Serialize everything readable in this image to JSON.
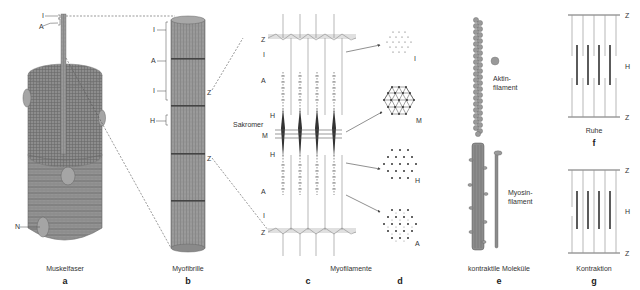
{
  "panels": {
    "a": {
      "letter": "a",
      "caption": "Muskelfaser",
      "labels": {
        "I": "I",
        "A": "A",
        "N": "N"
      }
    },
    "b": {
      "letter": "b",
      "caption": "Myofibrille",
      "labels": {
        "I_top": "I",
        "A": "A",
        "I_bottom": "I",
        "H": "H",
        "Z_top": "Z",
        "Z_bottom": "Z"
      }
    },
    "c": {
      "letter": "c",
      "labels": {
        "Z_top": "Z",
        "I_top": "I",
        "A_top": "A",
        "H_top": "H",
        "sarcomere": "Sakromer",
        "M": "M",
        "H_bottom": "H",
        "A_bottom": "A",
        "I_bottom": "I",
        "Z_bottom": "Z"
      }
    },
    "cd_caption": "Myofilamente",
    "d": {
      "letter": "d",
      "labels": {
        "I": "I",
        "M": "M",
        "H": "H",
        "A": "A"
      }
    },
    "e": {
      "letter": "e",
      "caption": "kontraktile Moleküle",
      "labels": {
        "actin": "Aktin-",
        "actin2": "filament",
        "myosin": "Myosin-",
        "myosin2": "filament"
      }
    },
    "f": {
      "letter": "f",
      "caption": "Ruhe",
      "labels": {
        "Z_top": "Z",
        "H": "H",
        "Z_bottom": "Z"
      }
    },
    "g": {
      "letter": "g",
      "caption": "Kontraktion",
      "labels": {
        "Z_top": "Z",
        "H": "H",
        "Z_bottom": "Z"
      }
    }
  },
  "colors": {
    "fiber": "#8a8a8a",
    "fiber_dark": "#5a5a5a",
    "line": "#555555",
    "light": "#bbbbbb",
    "band": "#dddddd"
  }
}
